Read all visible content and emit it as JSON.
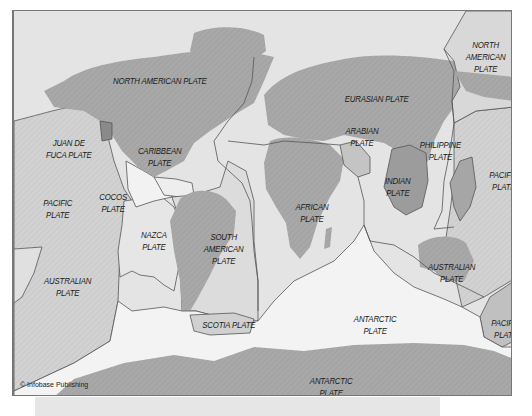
{
  "map": {
    "title": "Tectonic Plates of the World",
    "credit": "© Infobase Publishing",
    "colors": {
      "ocean": "#d4d4d4",
      "ocean_light": "#ececec",
      "land": "#a9a9a9",
      "minor_plate": "#b8b8b8",
      "indian_plate": "#9a9a9a",
      "boundary": "#555555",
      "frame": "#777777"
    },
    "plates": [
      {
        "id": "north-american-west",
        "lines": [
          "NORTH AMERICAN PLATE"
        ],
        "x": 95,
        "y": 66
      },
      {
        "id": "north-american-east",
        "lines": [
          "NORTH",
          "AMERICAN",
          "PLATE"
        ],
        "x": 450,
        "y": 30
      },
      {
        "id": "eurasian",
        "lines": [
          "EURASIAN PLATE"
        ],
        "x": 328,
        "y": 84
      },
      {
        "id": "juan-de-fuca",
        "lines": [
          "JUAN DE",
          "FUCA PLATE"
        ],
        "x": 18,
        "y": 126
      },
      {
        "id": "caribbean",
        "lines": [
          "CARIBBEAN",
          "PLATE"
        ],
        "x": 122,
        "y": 134
      },
      {
        "id": "arabian",
        "lines": [
          "ARABIAN",
          "PLATE"
        ],
        "x": 330,
        "y": 114
      },
      {
        "id": "philippine",
        "lines": [
          "PHILIPPINE",
          "PLATE"
        ],
        "x": 404,
        "y": 128
      },
      {
        "id": "indian",
        "lines": [
          "INDIAN",
          "PLATE"
        ],
        "x": 368,
        "y": 164
      },
      {
        "id": "pacific-east",
        "lines": [
          "PACIFIC",
          "PLATE"
        ],
        "x": 474,
        "y": 158
      },
      {
        "id": "pacific-west",
        "lines": [
          "PACIFIC",
          "PLATE"
        ],
        "x": 18,
        "y": 186
      },
      {
        "id": "cocos",
        "lines": [
          "COCOS",
          "PLATE"
        ],
        "x": 84,
        "y": 180
      },
      {
        "id": "african",
        "lines": [
          "AFRICAN",
          "PLATE"
        ],
        "x": 280,
        "y": 190
      },
      {
        "id": "nazca",
        "lines": [
          "NAZCA",
          "PLATE"
        ],
        "x": 122,
        "y": 218
      },
      {
        "id": "south-american",
        "lines": [
          "SOUTH",
          "AMERICAN",
          "PLATE"
        ],
        "x": 188,
        "y": 220
      },
      {
        "id": "australian-west",
        "lines": [
          "AUSTRALIAN",
          "PLATE"
        ],
        "x": 28,
        "y": 264
      },
      {
        "id": "australian-east",
        "lines": [
          "AUSTRALIAN",
          "PLATE"
        ],
        "x": 412,
        "y": 250
      },
      {
        "id": "scotia",
        "lines": [
          "SCOTIA PLATE"
        ],
        "x": 184,
        "y": 310
      },
      {
        "id": "antarctic-mid",
        "lines": [
          "ANTARCTIC",
          "PLATE"
        ],
        "x": 338,
        "y": 302
      },
      {
        "id": "pacific-southeast",
        "lines": [
          "PACIFIC",
          "PLATE"
        ],
        "x": 476,
        "y": 306
      },
      {
        "id": "antarctic-south",
        "lines": [
          "ANTARCTIC",
          "PLATE"
        ],
        "x": 294,
        "y": 366
      }
    ]
  }
}
